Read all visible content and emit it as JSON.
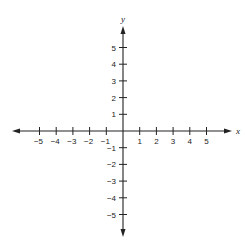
{
  "chart_data": {
    "type": "line",
    "title": "",
    "xlabel": "x",
    "ylabel": "y",
    "xlim": [
      -5,
      5
    ],
    "ylim": [
      -5,
      5
    ],
    "x_ticks": [
      -5,
      -4,
      -3,
      -2,
      -1,
      1,
      2,
      3,
      4,
      5
    ],
    "y_ticks": [
      5,
      4,
      3,
      2,
      1,
      -1,
      -2,
      -3,
      -4,
      -5
    ],
    "x_tick_labels": [
      "−5",
      "−4",
      "−3",
      "−2",
      "−1",
      "1",
      "2",
      "3",
      "4",
      "5"
    ],
    "y_tick_labels": [
      "5",
      "4",
      "3",
      "2",
      "1",
      "−1",
      "−2",
      "−3",
      "−4",
      "−5"
    ],
    "grid": false,
    "legend": null,
    "series": [],
    "axes_arrows": true,
    "colors": {
      "axis": "#222222",
      "background": "#ffffff"
    }
  }
}
